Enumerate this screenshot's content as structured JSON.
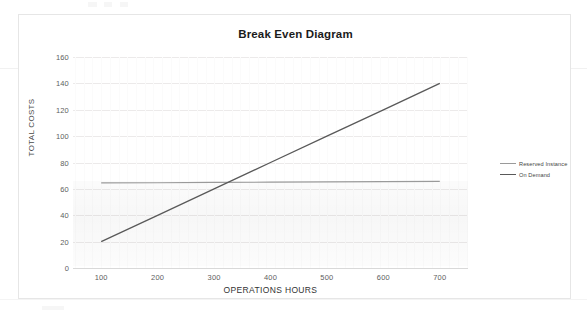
{
  "chart_data": {
    "type": "line",
    "title": "Break Even Diagram",
    "xlabel": "OPERATIONS HOURS",
    "ylabel": "TOTAL COSTS",
    "x": [
      100,
      200,
      300,
      400,
      500,
      600,
      700
    ],
    "xlim": [
      50,
      750
    ],
    "ylim": [
      0,
      160
    ],
    "xticks": [
      "100",
      "200",
      "300",
      "400",
      "500",
      "600",
      "700"
    ],
    "yticks": [
      "0",
      "20",
      "40",
      "60",
      "80",
      "100",
      "120",
      "140",
      "160"
    ],
    "grid": true,
    "legend_position": "right",
    "series": [
      {
        "name": "Reserved Instance",
        "color": "#9a9a9a",
        "values": [
          64.5,
          64.7,
          64.9,
          65.1,
          65.3,
          65.5,
          65.7
        ]
      },
      {
        "name": "On Demand",
        "color": "#595959",
        "values": [
          20,
          40,
          60,
          80,
          100,
          120,
          140
        ]
      }
    ],
    "annotations": {
      "break_even_x": 323,
      "break_even_y": 65
    }
  },
  "chart": {
    "title": "Break Even Diagram",
    "x_axis_title": "OPERATIONS HOURS",
    "y_axis_title": "TOTAL COSTS",
    "y_ticks": [
      "160",
      "140",
      "120",
      "100",
      "80",
      "60",
      "40",
      "20",
      "0"
    ],
    "x_ticks": [
      "100",
      "200",
      "300",
      "400",
      "500",
      "600",
      "700"
    ],
    "legend": [
      {
        "label": "Reserved Instance",
        "color": "#9a9a9a"
      },
      {
        "label": "On Demand",
        "color": "#595959"
      }
    ]
  }
}
